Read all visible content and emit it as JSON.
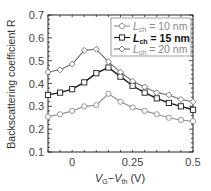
{
  "chart_data": {
    "type": "line",
    "title": "",
    "xlabel": "V_G − V_th (V)",
    "ylabel": "Backscattering coefficient R",
    "xlim": [
      -0.1,
      0.5
    ],
    "ylim": [
      0.1,
      0.7
    ],
    "xticks": [
      0,
      0.25,
      0.5
    ],
    "xtick_labels": [
      "0",
      "0.25",
      "0.5"
    ],
    "yticks": [
      0.1,
      0.2,
      0.3,
      0.4,
      0.5,
      0.6,
      0.7
    ],
    "ytick_labels": [
      "0.1",
      "0.2",
      "0.3",
      "0.4",
      "0.5",
      "0.6",
      "0.7"
    ],
    "grid": false,
    "legend_position": "upper right",
    "x": [
      -0.1,
      -0.05,
      0.0,
      0.05,
      0.1,
      0.15,
      0.2,
      0.25,
      0.3,
      0.35,
      0.4,
      0.45,
      0.5
    ],
    "series": [
      {
        "name": "L_ch = 10 nm",
        "color": "#8c8c8c",
        "marker": "circle",
        "values": [
          0.255,
          0.265,
          0.28,
          0.3,
          0.305,
          0.355,
          0.32,
          0.295,
          0.28,
          0.265,
          0.25,
          0.24,
          0.235
        ]
      },
      {
        "name": "L_ch = 15 nm",
        "color": "#1a1a1a",
        "marker": "square",
        "values": [
          0.35,
          0.36,
          0.375,
          0.405,
          0.445,
          0.47,
          0.43,
          0.39,
          0.36,
          0.335,
          0.315,
          0.3,
          0.285
        ]
      },
      {
        "name": "L_ch = 20 nm",
        "color": "#6e6e6e",
        "marker": "diamond",
        "values": [
          0.45,
          0.46,
          0.485,
          0.545,
          0.55,
          0.495,
          0.45,
          0.41,
          0.385,
          0.36,
          0.35,
          0.33,
          0.32
        ]
      }
    ]
  },
  "legend": {
    "items": [
      {
        "sym": "L",
        "sub": "ch",
        "rest": " = 10 nm"
      },
      {
        "sym": "L",
        "sub": "ch",
        "rest": " = 15 nm"
      },
      {
        "sym": "L",
        "sub": "ch",
        "rest": " = 20 nm"
      }
    ]
  },
  "axes": {
    "xlabel_parts": {
      "v1": "V",
      "s1": "G",
      "dash": "−",
      "v2": "V",
      "s2": "th",
      "unit": " (V)"
    },
    "ylabel": "Backscattering coefficient R"
  }
}
